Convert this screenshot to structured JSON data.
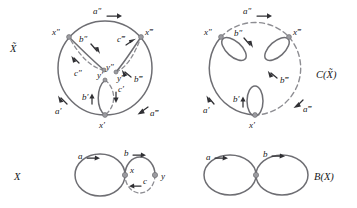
{
  "figure": {
    "kind": "topology-covering-space-diagram",
    "panels": [
      {
        "id": "x-tilde",
        "name": "universal-cover-panel",
        "title": "X̃",
        "description": "Large circle with interior arcs; covering space of X",
        "vertices": [
          {
            "id": "x-double-prime",
            "label": "x″"
          },
          {
            "id": "x-triple-prime",
            "label": "x‴"
          },
          {
            "id": "x-prime",
            "label": "x′"
          },
          {
            "id": "y-double-prime",
            "label": "y″"
          },
          {
            "id": "y-triple-prime",
            "label": "y‴"
          },
          {
            "id": "y-prime",
            "label": "y′"
          }
        ],
        "edges": [
          {
            "id": "a-double-prime",
            "label": "a″",
            "style": "solid"
          },
          {
            "id": "a-triple-prime",
            "label": "a‴",
            "style": "solid"
          },
          {
            "id": "a-prime",
            "label": "a′",
            "style": "solid"
          },
          {
            "id": "b-double-prime",
            "label": "b″",
            "style": "solid"
          },
          {
            "id": "b-triple-prime",
            "label": "b‴",
            "style": "solid"
          },
          {
            "id": "b-prime",
            "label": "b′",
            "style": "solid"
          },
          {
            "id": "c-double-prime",
            "label": "c″",
            "style": "dashed"
          },
          {
            "id": "c-triple-prime",
            "label": "c‴",
            "style": "dashed"
          },
          {
            "id": "c-prime",
            "label": "c′",
            "style": "dashed"
          }
        ]
      },
      {
        "id": "c-x-tilde",
        "name": "collapsed-cover-panel",
        "title": "C(X̃)",
        "description": "Circle with dashed upper-right arc and three small loops",
        "vertices": [
          {
            "id": "x-double-prime",
            "label": "x″"
          },
          {
            "id": "x-triple-prime",
            "label": "x‴"
          },
          {
            "id": "x-prime",
            "label": "x′"
          }
        ],
        "edges": [
          {
            "id": "a-double-prime",
            "label": "a″",
            "style": "dashed"
          },
          {
            "id": "a-triple-prime",
            "label": "a‴",
            "style": "dashed"
          },
          {
            "id": "a-prime",
            "label": "a′",
            "style": "solid"
          },
          {
            "id": "b-double-prime",
            "label": "b″",
            "style": "solid"
          },
          {
            "id": "b-triple-prime",
            "label": "b‴",
            "style": "solid"
          },
          {
            "id": "b-prime",
            "label": "b′",
            "style": "solid"
          }
        ]
      },
      {
        "id": "x-base",
        "name": "base-space-panel",
        "title": "X",
        "description": "Wedge of two circles; right circle has dashed lower half",
        "vertices": [
          {
            "id": "x",
            "label": "x"
          },
          {
            "id": "y",
            "label": "y"
          }
        ],
        "edges": [
          {
            "id": "a",
            "label": "a",
            "style": "solid"
          },
          {
            "id": "b",
            "label": "b",
            "style": "solid"
          },
          {
            "id": "c",
            "label": "c",
            "style": "dashed"
          }
        ]
      },
      {
        "id": "b-x",
        "name": "bouquet-panel",
        "title": "B(X)",
        "description": "Figure-eight / bouquet of two circles",
        "vertices": [
          {
            "id": "basepoint",
            "label": ""
          }
        ],
        "edges": [
          {
            "id": "a",
            "label": "a",
            "style": "solid"
          },
          {
            "id": "b",
            "label": "b",
            "style": "solid"
          }
        ]
      }
    ],
    "colors": {
      "curve_solid": "#6e6e73",
      "curve_dashed": "#8d8d92",
      "vertex_fill": "#9b9ba0",
      "text": "#18181a",
      "arrow": "#303034",
      "background": "#ffffff"
    }
  },
  "labels": {
    "panel_x_tilde": "X̃",
    "panel_c_x_tilde": "C(X̃)",
    "panel_x": "X",
    "panel_b_x": "B(X)",
    "a": "a",
    "b": "b",
    "c": "c",
    "x": "x",
    "y": "y",
    "a_prime": "a′",
    "a_dprime": "a″",
    "a_tprime": "a‴",
    "b_prime": "b′",
    "b_dprime": "b″",
    "b_tprime": "b‴",
    "c_prime": "c′",
    "c_dprime": "c″",
    "c_tprime": "c‴",
    "x_prime": "x′",
    "x_dprime": "x″",
    "x_tprime": "x‴",
    "y_prime": "y′",
    "y_dprime": "y″",
    "y_tprime": "y‴"
  }
}
